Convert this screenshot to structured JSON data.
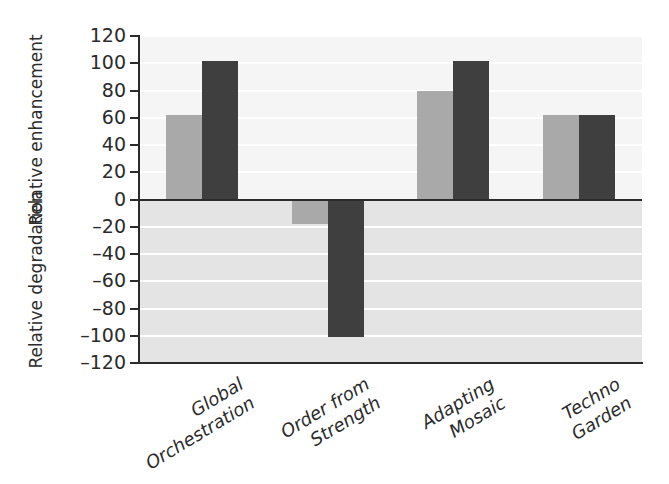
{
  "chart_data": {
    "type": "bar",
    "title": "",
    "subtitle": "",
    "xlabel": "",
    "ylabel_upper": "Relative enhancement",
    "ylabel_lower": "Relative degradation",
    "ylabel_upper_lines": [
      "Relative",
      "enhancement"
    ],
    "ylabel_lower_lines": [
      "Relative",
      "degradation"
    ],
    "categories": [
      "Global Orchestration",
      "Order from Strength",
      "Adapting Mosaic",
      "Techno Garden"
    ],
    "category_lines": [
      [
        "Global",
        "Orchestration"
      ],
      [
        "Order from",
        "Strength"
      ],
      [
        "Adapting",
        "Mosaic"
      ],
      [
        "Techno",
        "Garden"
      ]
    ],
    "series": [
      {
        "name": "light-gray-series",
        "color": "#a9a9a9",
        "values": [
          62,
          -18,
          80,
          62
        ]
      },
      {
        "name": "dark-gray-series",
        "color": "#3f3f3f",
        "values": [
          102,
          -101,
          102,
          62
        ]
      }
    ],
    "ylim": [
      -120,
      120
    ],
    "yticks": [
      120,
      100,
      80,
      60,
      40,
      20,
      0,
      -20,
      -40,
      -60,
      -80,
      -100,
      -120
    ],
    "ytick_labels": [
      "120",
      "100",
      "80",
      "60",
      "40",
      "20",
      "0",
      "–20",
      "–40",
      "–60",
      "–80",
      "–100",
      "–120"
    ],
    "grid": true,
    "gridline_color": "#ffffff",
    "legend": null,
    "panel_upper_bg": "#f5f5f5",
    "panel_lower_bg": "#e4e4e4",
    "axis_color": "#2b2b2b"
  }
}
